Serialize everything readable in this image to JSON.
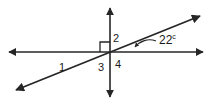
{
  "figure": {
    "stroke_color": "#262626",
    "text_color": "#1a1a1a",
    "background_color": "#ffffff"
  },
  "angle_labels": [
    {
      "id": "1",
      "text": "1"
    },
    {
      "id": "2",
      "text": "2"
    },
    {
      "id": "3",
      "text": "3"
    },
    {
      "id": "4",
      "text": "4"
    }
  ],
  "measures": {
    "given_angle_value": "22",
    "given_angle_unit": "c"
  },
  "markers": {
    "right_angle": "right-angle-square"
  }
}
